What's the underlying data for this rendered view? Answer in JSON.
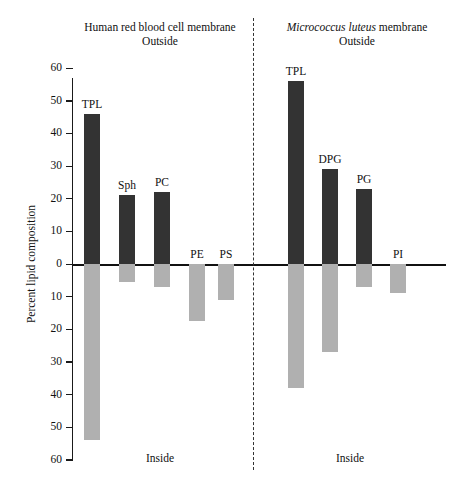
{
  "figure": {
    "ylabel": "Percent lipid composition",
    "ytick_labels_top": [
      "60",
      "50",
      "40",
      "30",
      "20",
      "10",
      "0"
    ],
    "ytick_labels_bottom": [
      "10",
      "20",
      "30",
      "40",
      "50",
      "60"
    ],
    "colors": {
      "outside_bar": "#333333",
      "inside_bar": "#b0b0b0",
      "axis": "#111111",
      "divider": "#333333"
    },
    "panels": [
      {
        "id": "human-rbc",
        "title_text": "Human red blood cell membrane",
        "title_italic_part": "",
        "outside_label": "Outside",
        "inside_label": "Inside"
      },
      {
        "id": "micrococcus-luteus",
        "title_italic_part": "Micrococcus luteus",
        "title_rest": " membrane",
        "outside_label": "Outside",
        "inside_label": "Inside"
      }
    ]
  },
  "chart_data": {
    "type": "bar",
    "xlabel": "",
    "ylabel": "Percent lipid composition",
    "ylim": [
      -60,
      60
    ],
    "y_axis_note": "Axis labels show absolute percent; values below the zero line represent the inner (Inside) leaflet.",
    "grid": false,
    "legend": [
      "Outside (dark)",
      "Inside (light gray)"
    ],
    "legend_position": "none",
    "panels": [
      {
        "name": "Human red blood cell membrane",
        "categories": [
          "TPL",
          "Sph",
          "PC",
          "PE",
          "PS"
        ],
        "series": [
          {
            "name": "Outside",
            "values": [
              46,
              21,
              22,
              0,
              0
            ]
          },
          {
            "name": "Inside",
            "values": [
              -54,
              -5.5,
              -7,
              -17.5,
              -11
            ]
          }
        ]
      },
      {
        "name": "Micrococcus luteus membrane",
        "categories": [
          "TPL",
          "DPG",
          "PG",
          "PI"
        ],
        "series": [
          {
            "name": "Outside",
            "values": [
              56,
              29,
              23,
              0
            ]
          },
          {
            "name": "Inside",
            "values": [
              -38,
              -27,
              -7,
              -9
            ]
          }
        ]
      }
    ]
  },
  "geometry": {
    "zero_y": 264,
    "px_per_unit": 3.265,
    "bar_width": 16,
    "left_bar_x": [
      84,
      119,
      154,
      189,
      218
    ],
    "right_bar_x": [
      288,
      322,
      356,
      390
    ]
  }
}
